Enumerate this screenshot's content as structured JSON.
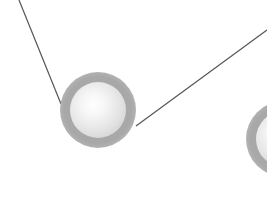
{
  "diagram": {
    "background": "#ffffff",
    "edge_color": "#555555",
    "halo_color": "#a8a8a8",
    "core_color": "#eeeeee",
    "nodes": [
      {
        "id": "node-1",
        "cx": 98,
        "cy": 110,
        "outer_r": 38,
        "inner_r": 28,
        "visible": "full"
      },
      {
        "id": "node-2",
        "cx": 284,
        "cy": 139,
        "outer_r": 38,
        "inner_r": 28,
        "visible": "partial-right-edge"
      }
    ],
    "edges": [
      {
        "id": "edge-1",
        "x1": 19,
        "y1": 0,
        "x2": 61,
        "y2": 104
      },
      {
        "id": "edge-2",
        "x1": 136,
        "y1": 126,
        "x2": 267,
        "y2": 30
      }
    ]
  }
}
